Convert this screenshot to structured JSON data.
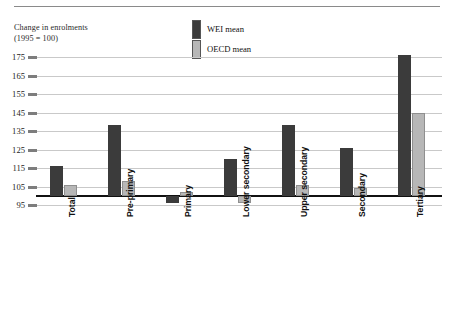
{
  "chart_data": {
    "type": "bar",
    "title": "Change in enrolments\n(1995 = 100)",
    "xlabel": "",
    "ylabel": "Change in enrolments (1995 = 100)",
    "ylim": [
      95,
      175
    ],
    "yticks": [
      95,
      105,
      115,
      125,
      135,
      145,
      155,
      165,
      175
    ],
    "grid": true,
    "baseline": 100,
    "legend_position": "top-center",
    "categories": [
      "Total",
      "Pre-primary",
      "Primary",
      "Lower secondary",
      "Upper secondary",
      "Secondary",
      "Tertiary"
    ],
    "series": [
      {
        "name": "WEI mean",
        "color": "#3b3b3b",
        "values": [
          116,
          138,
          96,
          120,
          138,
          126,
          176
        ]
      },
      {
        "name": "OECD mean",
        "color": "#b7b7b7",
        "values": [
          106,
          108,
          102,
          96,
          106,
          104,
          145
        ]
      }
    ]
  },
  "legend": {
    "items": [
      {
        "label": "WEI mean",
        "swatch": "#3b3b3b"
      },
      {
        "label": "OECD mean",
        "swatch": "#b7b7b7"
      }
    ]
  },
  "axis": {
    "title_line1": "Change in enrolments",
    "title_line2": "(1995 = 100)",
    "title": "Change in enrolments\n(1995 = 100)",
    "ytick_labels": [
      "175",
      "165",
      "155",
      "145",
      "135",
      "125",
      "115",
      "105",
      "95"
    ]
  }
}
